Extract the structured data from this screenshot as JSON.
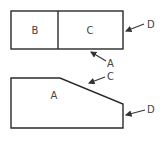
{
  "diagram": {
    "top_figure": {
      "regions": [
        {
          "label": "B"
        },
        {
          "label": "C"
        }
      ],
      "callouts": [
        {
          "label": "D",
          "target": "right edge of rectangle"
        },
        {
          "label": "A",
          "target": "bottom edge of rectangle"
        }
      ]
    },
    "bottom_figure": {
      "region_label": "A",
      "callouts": [
        {
          "label": "C",
          "target": "slanted top edge"
        },
        {
          "label": "D",
          "target": "right vertical edge"
        }
      ]
    },
    "colors": {
      "stroke": "#2a2a2a",
      "text": "#444444",
      "background": "#ffffff"
    }
  }
}
